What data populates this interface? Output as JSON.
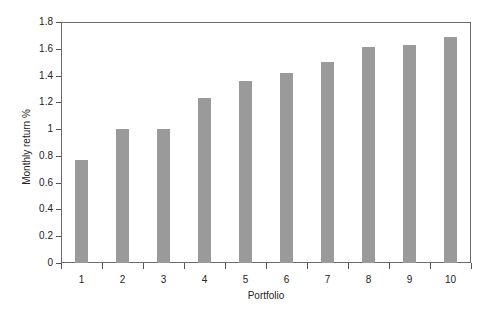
{
  "chart_data": {
    "type": "bar",
    "title": "",
    "xlabel": "Portfolio",
    "ylabel": "Monthly return %",
    "categories": [
      "1",
      "2",
      "3",
      "4",
      "5",
      "6",
      "7",
      "8",
      "9",
      "10"
    ],
    "values": [
      0.77,
      1.0,
      1.0,
      1.23,
      1.36,
      1.42,
      1.5,
      1.61,
      1.63,
      1.69
    ],
    "ylim": [
      0,
      1.8
    ],
    "yticks": [
      "0",
      "0.2",
      "0.4",
      "0.6",
      "0.8",
      "1",
      "1.2",
      "1.4",
      "1.6",
      "1.8"
    ],
    "grid": false,
    "legend": null,
    "bar_color": "#9a9a9a",
    "axis_color": "#555555"
  }
}
